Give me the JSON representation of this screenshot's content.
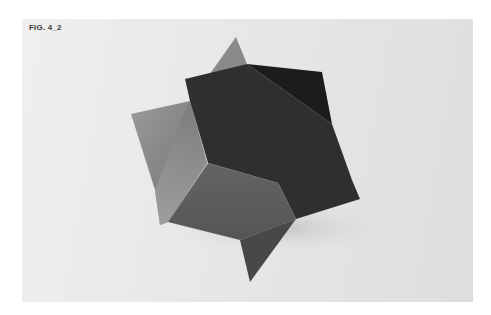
{
  "figure": {
    "caption": "FIG. 4_2",
    "colors": {
      "background_light": "#efefef",
      "background_dark": "#dedede",
      "dark_face": "#2f2f2f",
      "darkest_face": "#1c1c1c",
      "pentagon_face": "#5c5c5c",
      "left_flap": "#8c8c8c",
      "top_spike": "#8a8a8a",
      "bottom_spike": "#484848"
    }
  }
}
